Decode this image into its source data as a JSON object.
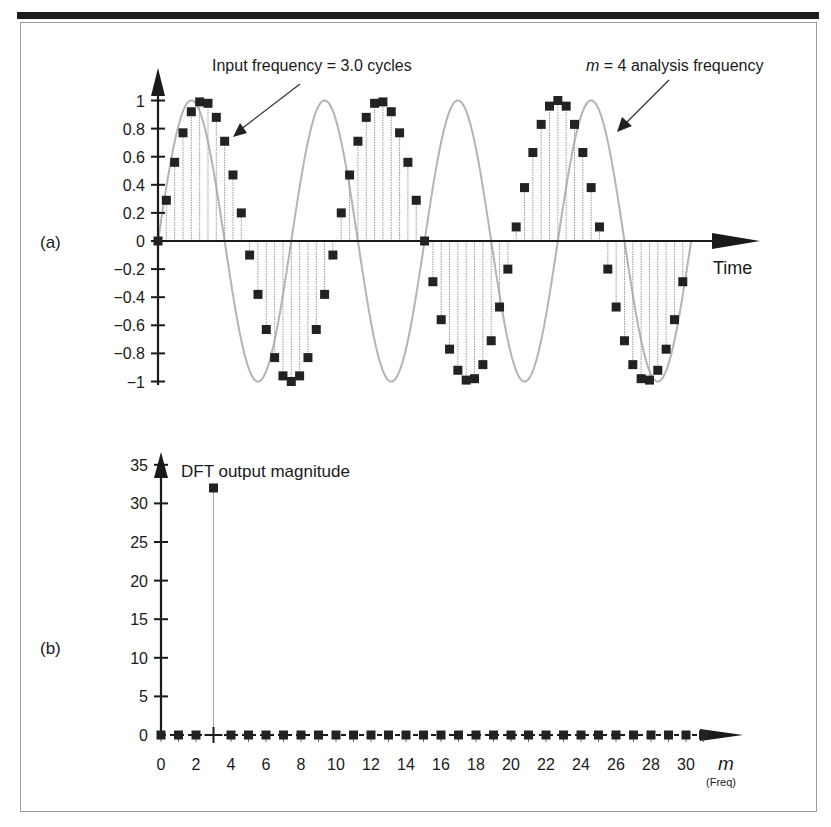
{
  "chart_data": [
    {
      "panel_label": "(a)",
      "type": "scatter",
      "title": "",
      "xlabel": "Time",
      "ylabel": "",
      "ylim": [
        -1,
        1
      ],
      "yticks": [
        "1",
        "0.8",
        "0.6",
        "0.4",
        "0.2",
        "0",
        "-0.2",
        "-0.4",
        "-0.6",
        "-0.8",
        "-1"
      ],
      "grid": false,
      "series": [
        {
          "name": "Input samples (3.0 cycles, 64 samples)",
          "style": "black square markers with dotted stems",
          "x": [
            0,
            1,
            2,
            3,
            4,
            5,
            6,
            7,
            8,
            9,
            10,
            11,
            12,
            13,
            14,
            15,
            16,
            17,
            18,
            19,
            20,
            21,
            22,
            23,
            24,
            25,
            26,
            27,
            28,
            29,
            30,
            31,
            32,
            33,
            34,
            35,
            36,
            37,
            38,
            39,
            40,
            41,
            42,
            43,
            44,
            45,
            46,
            47,
            48,
            49,
            50,
            51,
            52,
            53,
            54,
            55,
            56,
            57,
            58,
            59,
            60,
            61,
            62,
            63
          ],
          "values": [
            0,
            0.29,
            0.56,
            0.77,
            0.92,
            0.99,
            0.98,
            0.88,
            0.71,
            0.47,
            0.2,
            -0.1,
            -0.38,
            -0.63,
            -0.83,
            -0.96,
            -1,
            -0.96,
            -0.83,
            -0.63,
            -0.38,
            -0.1,
            0.2,
            0.47,
            0.71,
            0.88,
            0.98,
            0.99,
            0.92,
            0.77,
            0.56,
            0.29,
            0,
            -0.29,
            -0.56,
            -0.77,
            -0.92,
            -0.99,
            -0.98,
            -0.88,
            -0.71,
            -0.47,
            -0.2,
            0.1,
            0.38,
            0.63,
            0.83,
            0.96,
            1,
            0.96,
            0.83,
            0.63,
            0.38,
            0.1,
            -0.2,
            -0.47,
            -0.71,
            -0.88,
            -0.98,
            -0.99,
            -0.92,
            -0.77,
            -0.56,
            -0.29
          ]
        },
        {
          "name": "m = 4 analysis frequency",
          "style": "continuous gray sinusoid, 4 cycles",
          "cycles": 4
        }
      ],
      "annotations": [
        {
          "text": "Input frequency = 3.0 cycles",
          "points_to": "input samples"
        },
        {
          "text_italic": "m",
          "text": " = 4 analysis frequency",
          "points_to": "gray sinusoid"
        }
      ]
    },
    {
      "panel_label": "(b)",
      "type": "scatter",
      "title": "DFT output magnitude",
      "xlabel": "m",
      "xlabel_sub": "(Freq)",
      "ylabel": "",
      "ylim": [
        0,
        35
      ],
      "yticks": [
        "35",
        "30",
        "25",
        "20",
        "15",
        "10",
        "5",
        "0"
      ],
      "xticks": [
        "0",
        "2",
        "4",
        "6",
        "8",
        "10",
        "12",
        "14",
        "16",
        "18",
        "20",
        "22",
        "24",
        "26",
        "28",
        "30"
      ],
      "grid": false,
      "categories": [
        0,
        1,
        2,
        3,
        4,
        5,
        6,
        7,
        8,
        9,
        10,
        11,
        12,
        13,
        14,
        15,
        16,
        17,
        18,
        19,
        20,
        21,
        22,
        23,
        24,
        25,
        26,
        27,
        28,
        29,
        30,
        31
      ],
      "values": [
        0,
        0,
        0,
        32,
        0,
        0,
        0,
        0,
        0,
        0,
        0,
        0,
        0,
        0,
        0,
        0,
        0,
        0,
        0,
        0,
        0,
        0,
        0,
        0,
        0,
        0,
        0,
        0,
        0,
        0,
        0,
        0
      ]
    }
  ],
  "panel_a": {
    "label": "(a)",
    "annotation_input": "Input frequency = 3.0 cycles",
    "annotation_m": "m",
    "annotation_analysis": " = 4 analysis frequency",
    "xlabel": "Time",
    "yticks": [
      "1",
      "0.8",
      "0.6",
      "0.4",
      "0.2",
      "0",
      "−0.2",
      "−0.4",
      "−0.6",
      "−0.8",
      "−1"
    ]
  },
  "panel_b": {
    "label": "(b)",
    "title": "DFT output magnitude",
    "xlabel": "m",
    "xlabel_sub": "(Freq)",
    "yticks": [
      "35",
      "30",
      "25",
      "20",
      "15",
      "10",
      "5",
      "0"
    ],
    "xticks": [
      "0",
      "2",
      "4",
      "6",
      "8",
      "10",
      "12",
      "14",
      "16",
      "18",
      "20",
      "22",
      "24",
      "26",
      "28",
      "30"
    ]
  },
  "colors": {
    "ink": "#1a1a1a",
    "marker": "#222222",
    "analysis_curve": "#b4b4b4",
    "stem": "#9a9a9a",
    "frame": "#9a9a9a"
  }
}
